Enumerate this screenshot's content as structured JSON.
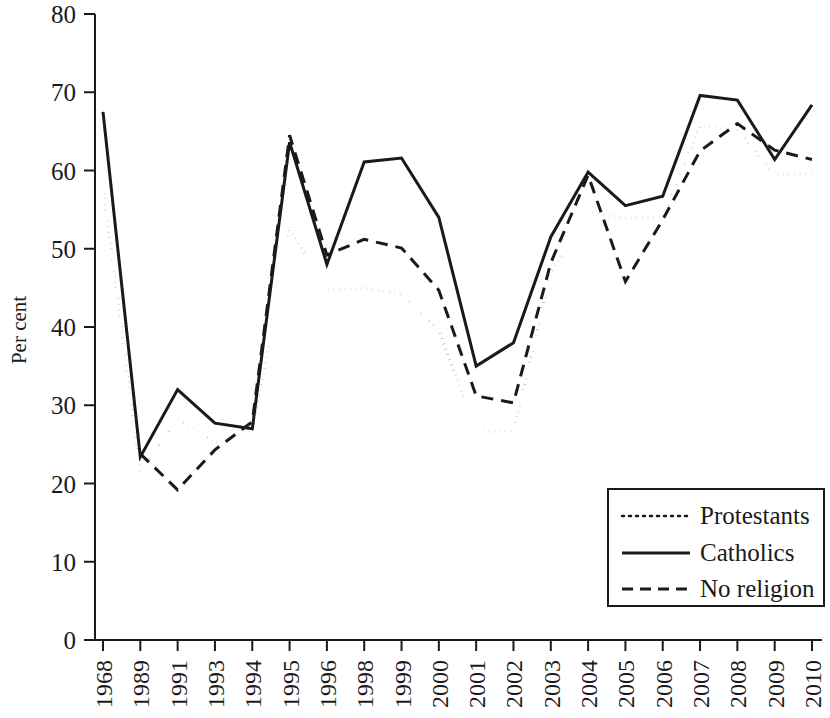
{
  "chart_data": {
    "type": "line",
    "title": "",
    "subtitle": "",
    "xlabel": "",
    "ylabel": "Per cent",
    "ylim": [
      0,
      80
    ],
    "ytick_step": 10,
    "yticks": [
      0,
      10,
      20,
      30,
      40,
      50,
      60,
      70,
      80
    ],
    "grid": false,
    "legend_position": "bottom-right",
    "categories": [
      "1968",
      "1989",
      "1991",
      "1993",
      "1994",
      "1995",
      "1996",
      "1998",
      "1999",
      "2000",
      "2001",
      "2002",
      "2003",
      "2004",
      "2005",
      "2006",
      "2007",
      "2008",
      "2009",
      "2010"
    ],
    "series": [
      {
        "name": "Protestants",
        "style": "dotted",
        "color": "#1a1a1a",
        "values": [
          57.8,
          21.5,
          28.3,
          25.2,
          26.8,
          52.4,
          44.7,
          45.0,
          44.1,
          39.6,
          26.6,
          26.7,
          47.0,
          54.7,
          53.9,
          54.0,
          65.7,
          65.2,
          59.4,
          59.6
        ],
        "start_index": 0
      },
      {
        "name": "Catholics",
        "style": "solid",
        "color": "#1a1a1a",
        "values": [
          67.5,
          23.4,
          32.0,
          27.7,
          27.0,
          63.6,
          48.0,
          61.1,
          61.6,
          54.0,
          35.0,
          38.0,
          51.5,
          59.8,
          55.5,
          56.7,
          69.6,
          69.0,
          61.4,
          68.4
        ],
        "start_index": 0
      },
      {
        "name": "No religion",
        "style": "dashed",
        "color": "#1a1a1a",
        "values": [
          null,
          23.8,
          19.2,
          24.3,
          27.9,
          64.5,
          49.2,
          51.2,
          50.1,
          44.7,
          31.2,
          30.3,
          48.2,
          59.4,
          45.8,
          53.7,
          62.5,
          66.0,
          62.6,
          61.4
        ],
        "start_index": 1
      }
    ]
  },
  "legend": {
    "entries": [
      {
        "label": "Protestants",
        "style": "dotted"
      },
      {
        "label": "Catholics",
        "style": "solid"
      },
      {
        "label": "No religion",
        "style": "dashed"
      }
    ]
  },
  "axes": {
    "y_axis_label": "Per cent",
    "y_tick_labels": [
      "80",
      "70",
      "60",
      "50",
      "40",
      "30",
      "20",
      "10",
      "0"
    ],
    "x_tick_labels": [
      "1968",
      "1989",
      "1991",
      "1993",
      "1994",
      "1995",
      "1996",
      "1998",
      "1999",
      "2000",
      "2001",
      "2002",
      "2003",
      "2004",
      "2005",
      "2006",
      "2007",
      "2008",
      "2009",
      "2010"
    ]
  }
}
